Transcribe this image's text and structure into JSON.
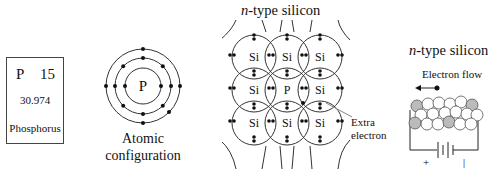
{
  "element_card": {
    "symbol": "P",
    "atomic_number": "15",
    "atomic_mass": "30.974",
    "name": "Phosphorus"
  },
  "atomic_model": {
    "nucleus_label": "P",
    "caption_line1": "Atomic",
    "caption_line2": "configuration",
    "shell_electrons": [
      2,
      8,
      5
    ]
  },
  "lattice": {
    "title_prefix": "n",
    "title_suffix": "-type silicon",
    "grid": [
      [
        "Si",
        "Si",
        "Si"
      ],
      [
        "Si",
        "P",
        "Si"
      ],
      [
        "Si",
        "Si",
        "Si"
      ]
    ],
    "annotation_line1": "Extra",
    "annotation_line2": "electron"
  },
  "circuit": {
    "title_prefix": "n",
    "title_suffix": "-type silicon",
    "flow_label": "Electron flow",
    "plus_label": "+",
    "minus_label": "|"
  },
  "colors": {
    "line": "#333333",
    "dopant_fill": "#b8b8b8",
    "atom_fill": "#ffffff"
  }
}
